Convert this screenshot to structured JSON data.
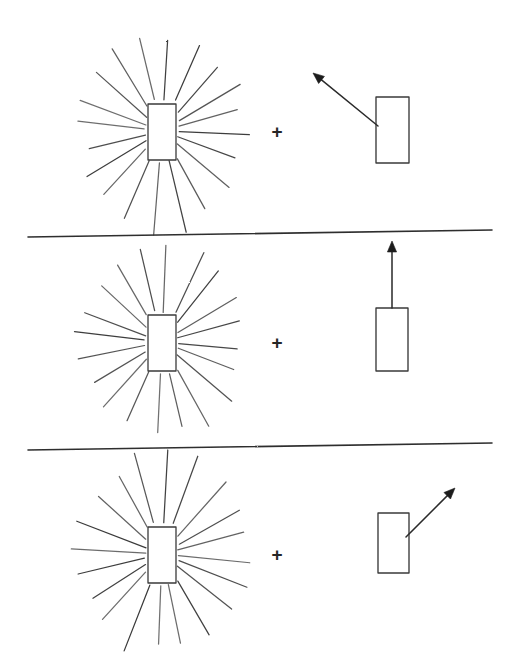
{
  "figure": {
    "background_color": "#ffffff",
    "ink_color": "#333333",
    "width": 519,
    "height": 663,
    "plus_symbol": "+",
    "rows": [
      {
        "id": "row-1",
        "label": "row-1",
        "starburst": {
          "center_x": 162,
          "center_y": 131,
          "ray_count": 20,
          "radius_x": 88,
          "radius_y": 105,
          "box": {
            "x": 148,
            "y": 104,
            "width": 28,
            "height": 56
          }
        },
        "operator": {
          "symbol": "+",
          "x": 277,
          "y": 131
        },
        "target": {
          "box": {
            "x": 376,
            "y": 97,
            "width": 33,
            "height": 66
          },
          "arrow": {
            "direction": "up-left",
            "from_x": 378,
            "from_y": 126,
            "to_x": 313,
            "to_y": 73,
            "anchor": "left-edge"
          }
        }
      },
      {
        "id": "row-2",
        "label": "row-2",
        "starburst": {
          "center_x": 162,
          "center_y": 342,
          "ray_count": 20,
          "radius_x": 88,
          "radius_y": 103,
          "box": {
            "x": 148,
            "y": 315,
            "width": 28,
            "height": 56
          }
        },
        "operator": {
          "symbol": "+",
          "x": 277,
          "y": 342
        },
        "target": {
          "box": {
            "x": 376,
            "y": 308,
            "width": 32,
            "height": 63
          },
          "arrow": {
            "direction": "up",
            "from_x": 392,
            "from_y": 308,
            "to_x": 392,
            "to_y": 241,
            "anchor": "top-edge"
          }
        }
      },
      {
        "id": "row-3",
        "label": "row-3",
        "starburst": {
          "center_x": 162,
          "center_y": 554,
          "ray_count": 20,
          "radius_x": 90,
          "radius_y": 106,
          "box": {
            "x": 148,
            "y": 527,
            "width": 28,
            "height": 56
          }
        },
        "operator": {
          "symbol": "+",
          "x": 277,
          "y": 554
        },
        "target": {
          "box": {
            "x": 378,
            "y": 513,
            "width": 31,
            "height": 60
          },
          "arrow": {
            "direction": "up-right",
            "from_x": 406,
            "from_y": 537,
            "to_x": 455,
            "to_y": 488,
            "anchor": "right-edge"
          }
        }
      }
    ],
    "dividers": [
      {
        "id": "divider-1",
        "x1": 28,
        "y1": 237,
        "x2": 492,
        "y2": 230
      },
      {
        "id": "divider-2",
        "x1": 28,
        "y1": 450,
        "x2": 492,
        "y2": 443
      }
    ]
  }
}
